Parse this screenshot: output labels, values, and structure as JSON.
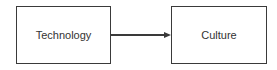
{
  "diagram": {
    "nodes": [
      {
        "id": "technology",
        "label": "Technology"
      },
      {
        "id": "culture",
        "label": "Culture"
      }
    ],
    "edges": [
      {
        "from": "technology",
        "to": "culture",
        "type": "arrow"
      }
    ],
    "colors": {
      "stroke": "#3a3a3a",
      "text": "#333333",
      "background": "#ffffff"
    }
  }
}
